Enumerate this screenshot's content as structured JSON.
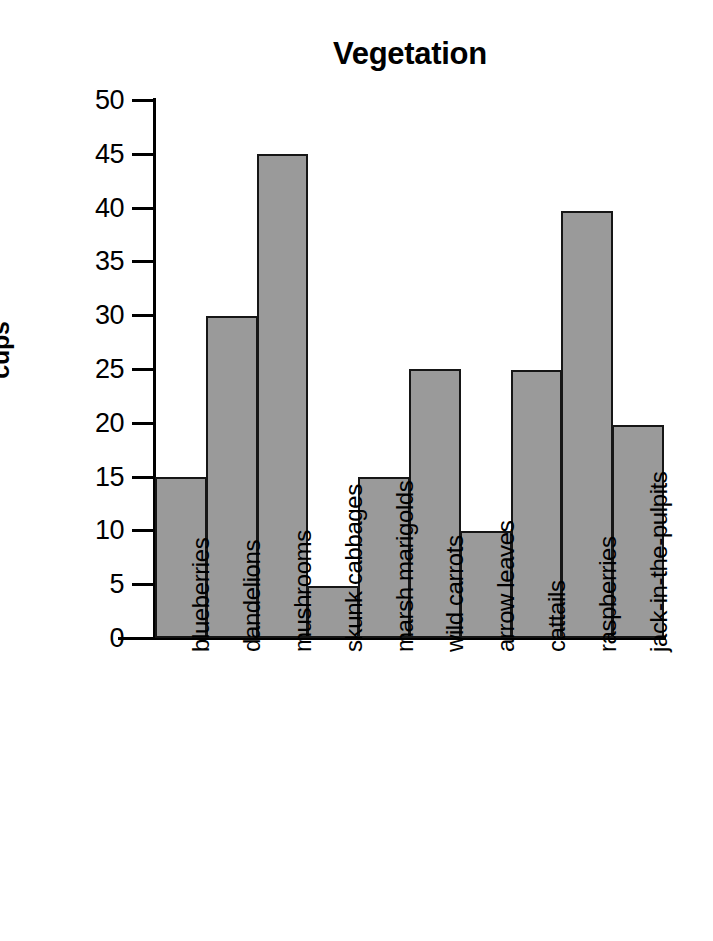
{
  "chart_data": {
    "type": "bar",
    "title": "Vegetation",
    "xlabel": "",
    "ylabel": "cups",
    "categories": [
      "blueberries",
      "dandelions",
      "mushrooms",
      "skunk cabbages",
      "marsh marigolds",
      "wild carrots",
      "arrow leaves",
      "cattails",
      "raspberries",
      "jack-in-the-pulpits"
    ],
    "values": [
      15,
      29.9,
      45,
      4.8,
      15,
      25,
      9.9,
      24.9,
      39.7,
      19.8
    ],
    "ylim": [
      0,
      50
    ],
    "ytick_labels": [
      "0",
      "5",
      "10",
      "15",
      "20",
      "25",
      "30",
      "35",
      "40",
      "45",
      "50"
    ],
    "ytick_values": [
      0,
      5,
      10,
      15,
      20,
      25,
      30,
      35,
      40,
      45,
      50
    ],
    "grid": false,
    "legend": false,
    "bar_color": "#9a9a9a",
    "bar_edge_color": "#161616",
    "background_color": "#ffffff",
    "text_color": "#000000"
  }
}
